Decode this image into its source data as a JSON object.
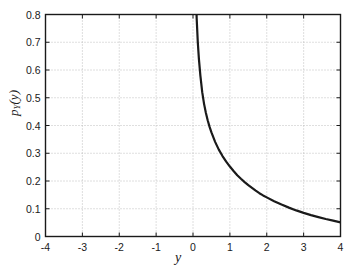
{
  "chart_data": {
    "type": "line",
    "title": "",
    "xlabel": "y",
    "ylabel_main": "p",
    "ylabel_sub": "Y",
    "ylabel_arg": "(y)",
    "ylabel_text": "pY(y)",
    "xlim": [
      -4,
      4
    ],
    "ylim": [
      0,
      0.8
    ],
    "xticks": [
      "-4",
      "-3",
      "-2",
      "-1",
      "0",
      "1",
      "2",
      "3",
      "4"
    ],
    "xtick_values": [
      -4,
      -3,
      -2,
      -1,
      0,
      1,
      2,
      3,
      4
    ],
    "yticks": [
      "0",
      "0.1",
      "0.2",
      "0.3",
      "0.4",
      "0.5",
      "0.6",
      "0.7",
      "0.8"
    ],
    "ytick_values": [
      0,
      0.1,
      0.2,
      0.3,
      0.4,
      0.5,
      0.6,
      0.7,
      0.8
    ],
    "grid": true,
    "grid_style": "dotted",
    "legend": null,
    "line_color": "#1a1a1a",
    "line_width": 2.2,
    "series": [
      {
        "name": "pY(y)",
        "x": [
          0.03,
          0.05,
          0.08,
          0.1,
          0.13,
          0.16,
          0.2,
          0.25,
          0.3,
          0.35,
          0.4,
          0.45,
          0.5,
          0.6,
          0.7,
          0.8,
          0.9,
          1.0,
          1.1,
          1.2,
          1.3,
          1.4,
          1.5,
          1.6,
          1.7,
          1.8,
          1.9,
          2.0,
          2.2,
          2.4,
          2.6,
          2.8,
          3.0,
          3.2,
          3.4,
          3.6,
          3.8,
          4.0
        ],
        "y": [
          1.38,
          1.08,
          0.87,
          0.785,
          0.7,
          0.64,
          0.58,
          0.52,
          0.478,
          0.445,
          0.418,
          0.395,
          0.375,
          0.341,
          0.313,
          0.29,
          0.27,
          0.252,
          0.236,
          0.221,
          0.208,
          0.196,
          0.185,
          0.175,
          0.165,
          0.156,
          0.148,
          0.141,
          0.127,
          0.115,
          0.104,
          0.094,
          0.085,
          0.077,
          0.07,
          0.063,
          0.057,
          0.051
        ]
      }
    ]
  },
  "axes": {
    "box_color": "#1a1a1a",
    "grid_color": "#b8b8b8",
    "background": "#ffffff"
  }
}
